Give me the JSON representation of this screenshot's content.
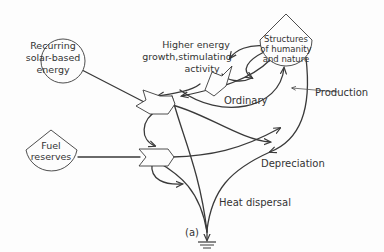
{
  "diagram": {
    "nodes": {
      "solar": {
        "line1": "Recurring",
        "line2": "solar-based",
        "line3": "energy"
      },
      "fuel": {
        "line1": "Fuel",
        "line2": "reserves"
      },
      "structures": {
        "line1": "Structures",
        "line2": "of humanity",
        "line3": "and nature"
      },
      "higher_energy": {
        "line1": "Higher energy",
        "line2": "growth,stimulating",
        "line3": "activity"
      }
    },
    "labels": {
      "ordinary": "Ordinary",
      "production": "Production",
      "depreciation": "Depreciation",
      "heat_dispersal": "Heat dispersal",
      "caption": "(a)"
    },
    "colors": {
      "line": "#3a3a3a",
      "background": "#fdfdfd"
    }
  }
}
